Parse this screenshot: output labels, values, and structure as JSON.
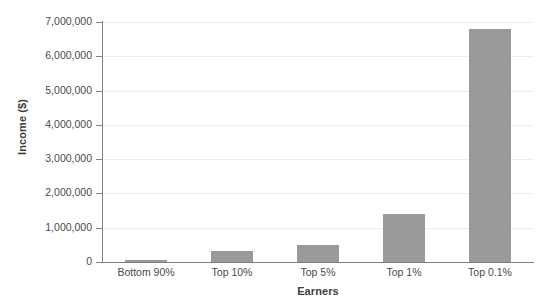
{
  "chart_data": {
    "type": "bar",
    "title": "",
    "categories": [
      "Bottom 90%",
      "Top 10%",
      "Top 5%",
      "Top 1%",
      "Top 0.1%"
    ],
    "values": [
      35000,
      330000,
      500000,
      1400000,
      6800000
    ],
    "xlabel": "Earners",
    "ylabel": "Income ($)",
    "ylim": [
      0,
      7000000
    ],
    "ytick_values": [
      0,
      1000000,
      2000000,
      3000000,
      4000000,
      5000000,
      6000000,
      7000000
    ],
    "ytick_labels": [
      "0",
      "1,000,000",
      "2,000,000",
      "3,000,000",
      "4,000,000",
      "5,000,000",
      "6,000,000",
      "7,000,000"
    ],
    "grid": true,
    "legend": "none",
    "series": [
      {
        "name": "Income",
        "color": "#9a9a9a",
        "values": [
          35000,
          330000,
          500000,
          1400000,
          6800000
        ]
      }
    ],
    "colors": {
      "bar": "#9a9a9a",
      "gridline": "#ededed",
      "axis": "#808080",
      "tick_text": "#4a4a4a",
      "axis_title": "#3d3d3d",
      "background": "#ffffff"
    }
  },
  "axes": {
    "y_title": "Income ($)",
    "x_title": "Earners"
  }
}
